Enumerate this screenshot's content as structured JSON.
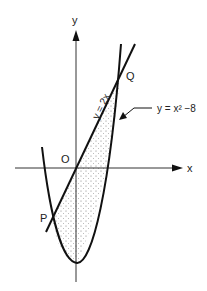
{
  "diagram": {
    "labels": {
      "y_axis": "y",
      "x_axis": "x",
      "origin": "O",
      "point_p": "P",
      "point_q": "Q",
      "line_eq": "y = 2x",
      "parabola_eq": "y = x² −8"
    },
    "colors": {
      "stroke": "#111111",
      "axis": "#333333",
      "shading_dots": "#666666"
    }
  }
}
